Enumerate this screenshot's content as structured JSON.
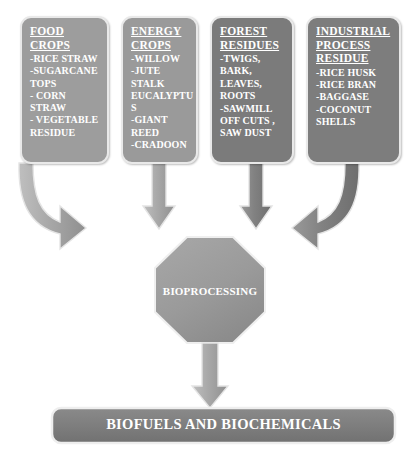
{
  "diagram": {
    "colors": {
      "card_light": "#9d9d9d",
      "card_dark": "#7b7b7b",
      "card_border": "#e9e9e9",
      "arrow_light": "#a9a9a9",
      "arrow_dark": "#7e7e7e",
      "octagon_fill": "#9d9d9d",
      "bottom_bar_fill": "#7e7e7e",
      "text": "#ffffff",
      "background": "#ffffff"
    }
  },
  "cards": [
    {
      "id": "food-crops",
      "title": "FOOD\nCROPS",
      "items": "-RICE STRAW\n-SUGARCANE\nTOPS\n- CORN STRAW\n- VEGETABLE\nRESIDUE"
    },
    {
      "id": "energy-crops",
      "title": "ENERGY\nCROPS",
      "items": "-WILLOW\n-JUTE\nSTALK\nEUCALYPTU\nS\n-GIANT\nREED\n-CRADOON"
    },
    {
      "id": "forest-residues",
      "title": "FOREST\nRESIDUES",
      "items": "-TWIGS,\nBARK,\nLEAVES,\nROOTS\n-SAWMILL\nOFF CUTS ,\nSAW DUST"
    },
    {
      "id": "industrial-process-residue",
      "title": "INDUSTRIAL\nPROCESS\nRESIDUE",
      "items": "-RICE HUSK\n-RICE BRAN\n-BAGGASE\n-COCONUT\nSHELLS"
    }
  ],
  "process": {
    "label": "BIOPROCESSING"
  },
  "output": {
    "label": "BIOFUELS AND BIOCHEMICALS"
  },
  "arrows": [
    {
      "id": "arrow-curved-left",
      "shape": "curved-right-then-down"
    },
    {
      "id": "arrow-straight-energy",
      "shape": "straight-down"
    },
    {
      "id": "arrow-straight-forest",
      "shape": "straight-down"
    },
    {
      "id": "arrow-curved-right",
      "shape": "curved-left-then-down"
    },
    {
      "id": "arrow-process-to-output",
      "shape": "straight-down"
    }
  ]
}
